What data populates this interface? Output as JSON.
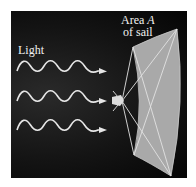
{
  "diagram": {
    "labels": {
      "light": "Light",
      "area_line1_prefix": "Area ",
      "area_variable": "A",
      "area_line2": "of sail"
    },
    "waves": {
      "count": 3,
      "periods_each": 3,
      "color": "#e6e6e6"
    },
    "sail": {
      "fill": "#a9a9a9",
      "line_color": "#e0e0e0"
    },
    "background": "#0c0c0c"
  }
}
